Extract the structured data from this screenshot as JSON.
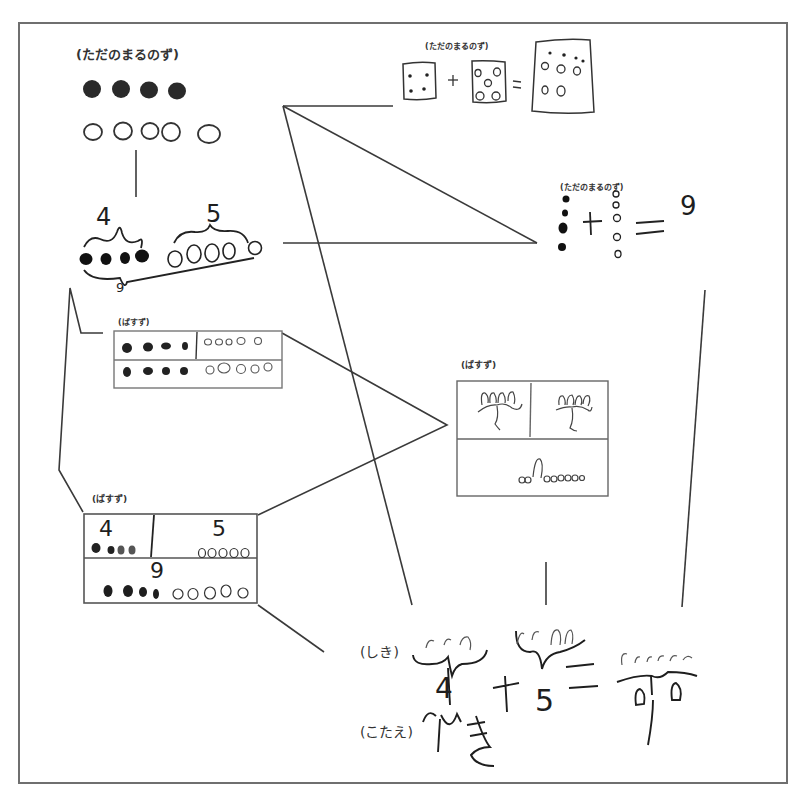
{
  "worksheet": {
    "topic": "4 + 5 = 9 multiple representations",
    "frame_color": "#6f6f6f",
    "ink_color": "#1e1e1e"
  },
  "labels": {
    "plain_dots": "(ただのまるのず)",
    "tape": "(ばすず)",
    "shiki": "(しき)",
    "kotae": "(こたえ)"
  },
  "dot_figure_top_left": {
    "label": "(ただのまるのず)",
    "filled_count": 4,
    "open_count": 5
  },
  "brace_figure": {
    "left_number": "4",
    "right_number": "5",
    "total_number": "9",
    "filled_count": 4,
    "open_count": 5
  },
  "dice_figure": {
    "label": "(ただのまるのず)",
    "first_dots": 4,
    "second_dots": 5,
    "plus": "+",
    "equals": "=",
    "result_dots": 9
  },
  "vertical_dot_figure": {
    "label": "(ただのまるのず)",
    "filled_count": 4,
    "open_count": 5,
    "plus": "+",
    "equals": "=",
    "result": "9"
  },
  "tape_small": {
    "label": "(ばすず)",
    "top_left_filled": 4,
    "top_right_open": 5,
    "bottom_filled": 4,
    "bottom_open": 5
  },
  "tape_numbers": {
    "label": "(ばすず)",
    "left_number": "4",
    "right_number": "5",
    "total_number": "9",
    "left_filled": 4,
    "right_open": 5,
    "bottom_filled": 4,
    "bottom_open": 5
  },
  "tape_tulips": {
    "label": "(ばすず)",
    "left_count": 4,
    "right_count": 5,
    "bottom_count": 9
  },
  "equation": {
    "shiki_label": "(しき)",
    "left": "4",
    "plus": "+",
    "right": "5",
    "equals": "=",
    "result": "9",
    "kotae_label": "(こたえ)",
    "answer": "9ひき"
  }
}
